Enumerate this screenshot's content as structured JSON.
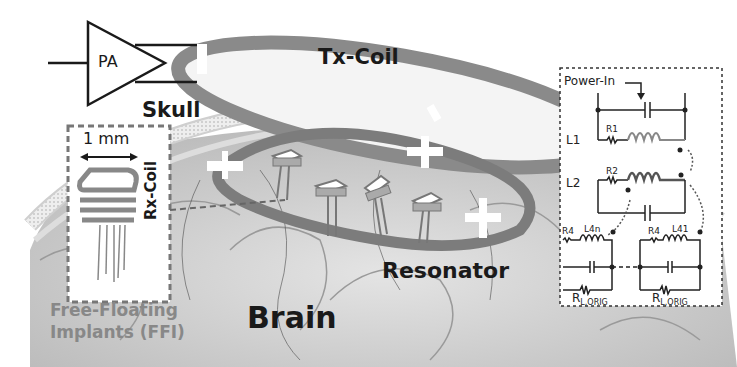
{
  "figure": {
    "labels": {
      "pa": "PA",
      "tx_coil": "Tx-Coil",
      "skull": "Skull",
      "scale": "1 mm",
      "rx_coil": "Rx-Coil",
      "ffi_line1": "Free-Floating",
      "ffi_line2": "Implants (FFI)",
      "brain": "Brain",
      "resonator": "Resonator"
    },
    "circuit": {
      "power_in": "Power-In",
      "l1": "L1",
      "l2": "L2",
      "r1": "R1",
      "r2": "R2",
      "r4_left": "R4",
      "r4_right": "R4",
      "l4n": "L4n",
      "l41": "L41",
      "rl_left": "R",
      "rl_left_sub": "L,ORIG",
      "rl_right": "R",
      "rl_right_sub": "L,ORIG"
    },
    "colors": {
      "brain_bg": "#cfcfcf",
      "coil": "#8a8a8a",
      "ink": "#1a1a1a",
      "implant": "#888888"
    }
  }
}
